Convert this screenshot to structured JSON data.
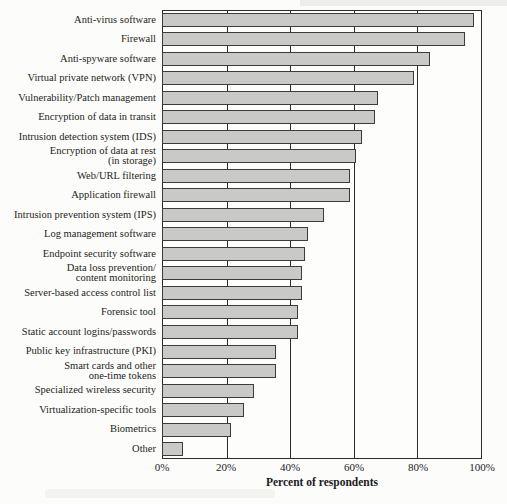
{
  "chart_data": {
    "type": "bar",
    "orientation": "horizontal",
    "title": "",
    "xlabel": "Percent of respondents",
    "ylabel": "",
    "xlim": [
      0,
      100
    ],
    "xtick_labels": [
      "0%",
      "20%",
      "40%",
      "60%",
      "80%",
      "100%"
    ],
    "xtick_values": [
      0,
      20,
      40,
      60,
      80,
      100
    ],
    "grid": true,
    "legend_position": "none",
    "bar_fill_color": "#c9c9c7",
    "bar_border_color": "#3c3c3c",
    "frame_color": "#2b2b2b",
    "categories": [
      "Anti-virus software",
      "Firewall",
      "Anti-spyware software",
      "Virtual private network (VPN)",
      "Vulnerability/Patch management",
      "Encryption of data in transit",
      "Intrusion detection system (IDS)",
      "Encryption of data at rest\n(in storage)",
      "Web/URL filtering",
      "Application firewall",
      "Intrusion prevention system (IPS)",
      "Log management software",
      "Endpoint security software",
      "Data loss prevention/\ncontent monitoring",
      "Server-based access control list",
      "Forensic tool",
      "Static account logins/passwords",
      "Public key infrastructure (PKI)",
      "Smart cards and other\none-time tokens",
      "Specialized wireless security",
      "Virtualization-specific tools",
      "Biometrics",
      "Other"
    ],
    "values": [
      97,
      94,
      83,
      78,
      67,
      66,
      62,
      60,
      58,
      58,
      50,
      45,
      44,
      43,
      43,
      42,
      42,
      35,
      35,
      28,
      25,
      21,
      6
    ]
  }
}
